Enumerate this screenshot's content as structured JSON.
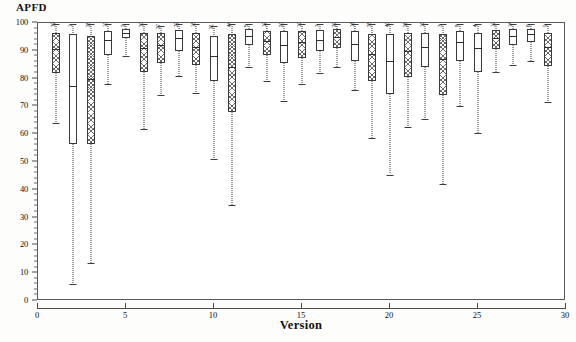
{
  "chart": {
    "title": "",
    "ylabel": "APFD",
    "xlabel": "Version",
    "background_color": "#ffffff",
    "frame_color": "#5a5a5a",
    "line_color": "#3c3c3c"
  },
  "chart_data": {
    "type": "box",
    "title": "",
    "ylabel": "APFD",
    "xlabel": "Version",
    "ylim": [
      0,
      100
    ],
    "xlim": [
      0,
      30
    ],
    "yticks": [
      0,
      10,
      20,
      30,
      40,
      50,
      60,
      70,
      80,
      90,
      100
    ],
    "xticks": [
      0,
      5,
      10,
      15,
      20,
      25,
      30
    ],
    "grid": false,
    "legend": null,
    "boxes": [
      {
        "version": 1,
        "label": "32",
        "whisker_low": 64.0,
        "q1": 82.0,
        "median": 90.5,
        "q3": 96.5,
        "whisker_high": 99.5,
        "fill": "hatched"
      },
      {
        "version": 2,
        "label": "1",
        "whisker_low": 6.0,
        "q1": 56.5,
        "median": 77.5,
        "q3": 96.0,
        "whisker_high": 99.5,
        "fill": "white"
      },
      {
        "version": 3,
        "label": "25",
        "whisker_low": 13.5,
        "q1": 56.5,
        "median": 80.0,
        "q3": 95.5,
        "whisker_high": 99.5,
        "fill": "hatched"
      },
      {
        "version": 4,
        "label": "13",
        "whisker_low": 78.0,
        "q1": 88.5,
        "median": 94.0,
        "q3": 97.0,
        "whisker_high": 99.5,
        "fill": "white"
      },
      {
        "version": 5,
        "label": "2",
        "whisker_low": 88.0,
        "q1": 94.5,
        "median": 96.5,
        "q3": 98.0,
        "whisker_high": 99.5,
        "fill": "white"
      },
      {
        "version": 6,
        "label": "30",
        "whisker_low": 62.0,
        "q1": 82.5,
        "median": 91.0,
        "q3": 96.5,
        "whisker_high": 99.5,
        "fill": "hatched"
      },
      {
        "version": 7,
        "label": "27",
        "whisker_low": 74.0,
        "q1": 85.5,
        "median": 92.0,
        "q3": 96.5,
        "whisker_high": 99.0,
        "fill": "hatched"
      },
      {
        "version": 8,
        "label": "22",
        "whisker_low": 81.0,
        "q1": 90.0,
        "median": 94.5,
        "q3": 97.5,
        "whisker_high": 99.5,
        "fill": "white"
      },
      {
        "version": 9,
        "label": "18",
        "whisker_low": 75.0,
        "q1": 85.0,
        "median": 91.5,
        "q3": 96.5,
        "whisker_high": 99.5,
        "fill": "hatched"
      },
      {
        "version": 10,
        "label": "21",
        "whisker_low": 51.0,
        "q1": 79.0,
        "median": 88.0,
        "q3": 95.5,
        "whisker_high": 99.0,
        "fill": "white"
      },
      {
        "version": 11,
        "label": "44",
        "whisker_low": 34.5,
        "q1": 68.0,
        "median": 84.0,
        "q3": 96.0,
        "whisker_high": 99.5,
        "fill": "hatched"
      },
      {
        "version": 12,
        "label": "5",
        "whisker_low": 84.0,
        "q1": 92.0,
        "median": 95.5,
        "q3": 98.0,
        "whisker_high": 99.5,
        "fill": "white"
      },
      {
        "version": 13,
        "label": "12",
        "whisker_low": 79.0,
        "q1": 88.5,
        "median": 93.5,
        "q3": 97.0,
        "whisker_high": 99.5,
        "fill": "hatched"
      },
      {
        "version": 14,
        "label": "23",
        "whisker_low": 72.0,
        "q1": 85.5,
        "median": 92.0,
        "q3": 97.0,
        "whisker_high": 99.5,
        "fill": "white"
      },
      {
        "version": 15,
        "label": "19",
        "whisker_low": 78.0,
        "q1": 87.5,
        "median": 93.0,
        "q3": 97.0,
        "whisker_high": 99.5,
        "fill": "hatched"
      },
      {
        "version": 16,
        "label": "7",
        "whisker_low": 82.0,
        "q1": 90.0,
        "median": 94.0,
        "q3": 97.5,
        "whisker_high": 99.5,
        "fill": "white"
      },
      {
        "version": 17,
        "label": "29",
        "whisker_low": 84.0,
        "q1": 91.0,
        "median": 95.0,
        "q3": 98.0,
        "whisker_high": 99.5,
        "fill": "hatched"
      },
      {
        "version": 18,
        "label": "16",
        "whisker_low": 76.0,
        "q1": 86.5,
        "median": 92.5,
        "q3": 97.0,
        "whisker_high": 99.5,
        "fill": "white"
      },
      {
        "version": 19,
        "label": "35",
        "whisker_low": 58.5,
        "q1": 79.0,
        "median": 89.0,
        "q3": 96.0,
        "whisker_high": 99.5,
        "fill": "hatched"
      },
      {
        "version": 20,
        "label": "40",
        "whisker_low": 45.5,
        "q1": 74.5,
        "median": 86.5,
        "q3": 96.0,
        "whisker_high": 99.5,
        "fill": "white"
      },
      {
        "version": 21,
        "label": "26",
        "whisker_low": 62.5,
        "q1": 80.5,
        "median": 90.0,
        "q3": 96.5,
        "whisker_high": 99.5,
        "fill": "hatched"
      },
      {
        "version": 22,
        "label": "11",
        "whisker_low": 65.5,
        "q1": 84.0,
        "median": 91.5,
        "q3": 96.5,
        "whisker_high": 99.5,
        "fill": "white"
      },
      {
        "version": 23,
        "label": "3",
        "whisker_low": 42.0,
        "q1": 74.0,
        "median": 87.0,
        "q3": 96.0,
        "whisker_high": 99.5,
        "fill": "hatched"
      },
      {
        "version": 24,
        "label": "8",
        "whisker_low": 70.0,
        "q1": 86.5,
        "median": 93.0,
        "q3": 97.0,
        "whisker_high": 99.5,
        "fill": "white"
      },
      {
        "version": 25,
        "label": "4",
        "whisker_low": 60.5,
        "q1": 82.5,
        "median": 91.0,
        "q3": 96.5,
        "whisker_high": 99.5,
        "fill": "white"
      },
      {
        "version": 26,
        "label": "17",
        "whisker_low": 82.5,
        "q1": 90.5,
        "median": 94.5,
        "q3": 97.5,
        "whisker_high": 99.5,
        "fill": "hatched"
      },
      {
        "version": 27,
        "label": "14",
        "whisker_low": 85.0,
        "q1": 92.0,
        "median": 95.5,
        "q3": 98.0,
        "whisker_high": 99.5,
        "fill": "white"
      },
      {
        "version": 28,
        "label": "6",
        "whisker_low": 86.5,
        "q1": 93.0,
        "median": 96.0,
        "q3": 98.0,
        "whisker_high": 99.5,
        "fill": "white"
      },
      {
        "version": 29,
        "label": "9",
        "whisker_low": 71.5,
        "q1": 84.5,
        "median": 91.5,
        "q3": 96.5,
        "whisker_high": 99.5,
        "fill": "hatched"
      }
    ]
  }
}
